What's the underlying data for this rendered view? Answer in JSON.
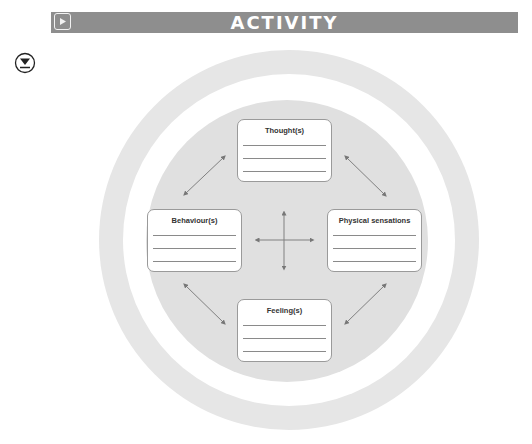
{
  "header": {
    "title": "ACTIVITY",
    "play_icon": "play-icon",
    "background_color": "#8e8e8e"
  },
  "download_icon": "download-icon",
  "diagram": {
    "ring_colors": {
      "outer": "#e6e6e6",
      "gap": "#ffffff",
      "inner": "#e0e0e0"
    },
    "boxes": [
      {
        "id": "thoughts",
        "label": "Thought(s)",
        "lines": 3
      },
      {
        "id": "behaviours",
        "label": "Behaviour(s)",
        "lines": 3
      },
      {
        "id": "physical-sensations",
        "label": "Physical sensations",
        "lines": 3
      },
      {
        "id": "feelings",
        "label": "Feeling(s)",
        "lines": 3
      }
    ],
    "connections": [
      {
        "from": "behaviours",
        "to": "thoughts",
        "type": "double-arrow"
      },
      {
        "from": "thoughts",
        "to": "physical-sensations",
        "type": "double-arrow"
      },
      {
        "from": "behaviours",
        "to": "feelings",
        "type": "double-arrow"
      },
      {
        "from": "feelings",
        "to": "physical-sensations",
        "type": "double-arrow"
      },
      {
        "from": "behaviours",
        "to": "physical-sensations",
        "type": "center-cross-horizontal"
      },
      {
        "from": "thoughts",
        "to": "feelings",
        "type": "center-cross-vertical"
      }
    ]
  }
}
